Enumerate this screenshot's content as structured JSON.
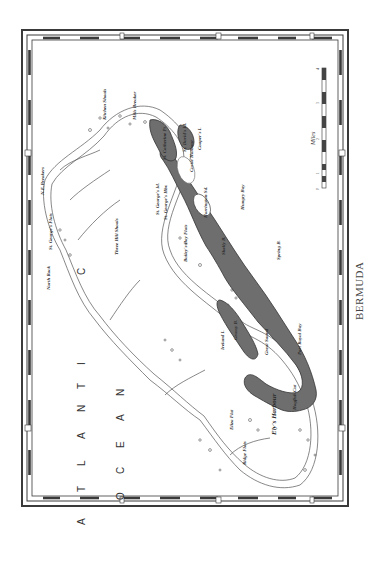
{
  "map": {
    "caption": "BERMUDA",
    "ocean_label": {
      "line1": [
        "A",
        "T",
        "L",
        "A",
        "N",
        "T",
        "I",
        "C"
      ],
      "line2": [
        "O",
        "C",
        "E",
        "A",
        "N"
      ]
    },
    "scale": {
      "title": "Miles",
      "ticks": [
        "0",
        "1",
        "2",
        "3",
        "4"
      ]
    },
    "colors": {
      "land": "#6e6e6e",
      "reef_line": "#555555",
      "frame": "#3a3a3a",
      "paper": "#ffffff"
    },
    "labels": {
      "kitchen_shoals": "Kitchen Shoals",
      "mills_breaker": "Mills Breaker",
      "ne_breakers": "N.E.Breakers",
      "north_rock": "North Rock",
      "st_georges_flats": "St. George's Flats",
      "three_hill_shoals": "Three Hill Shoals",
      "st_catherine": "St. Catherine Pt.",
      "st_davids": "St. David's Id.",
      "st_georges": "St. George's Id.",
      "st_georges_hbr": "St. George's Hbr.",
      "castle_harbour": "Castle Harbour",
      "cooper": "Cooper's I.",
      "baileys_bay_flats": "Bailey's Bay Flats",
      "harrington": "Harrington Sd.",
      "shelly": "Shelly B.",
      "hungry": "Hungry Bay",
      "great_sound": "Great Sound",
      "ireland": "Ireland I.",
      "grassy_bay": "Grassy B.",
      "port_royal_bay": "Port Royal Bay",
      "elys_harbour": "Ely's Harbour",
      "hogfish_cut": "Hogfish Cut",
      "eliza_flat": "Eliza Flat",
      "ridge_flats": "Ridge Flats",
      "spring": "Spring B."
    }
  }
}
